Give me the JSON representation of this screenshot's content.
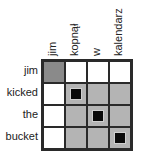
{
  "diagram": {
    "type": "alignment-matrix",
    "columns": [
      "jim",
      "kopnął",
      "w",
      "kalendarz"
    ],
    "rows": [
      "jim",
      "kicked",
      "the",
      "bucket"
    ],
    "cells": [
      [
        "dark",
        "white",
        "white",
        "white"
      ],
      [
        "white",
        "gray-mark",
        "gray",
        "gray"
      ],
      [
        "white",
        "gray",
        "gray-mark",
        "gray"
      ],
      [
        "white",
        "gray",
        "gray",
        "gray-mark"
      ]
    ],
    "colors": {
      "dark_cell": "#8a8a8a",
      "gray_cell": "#b4b4b4",
      "white_cell": "#ffffff",
      "mark": "#0a0a0a",
      "border": "#2a2a2a"
    }
  }
}
